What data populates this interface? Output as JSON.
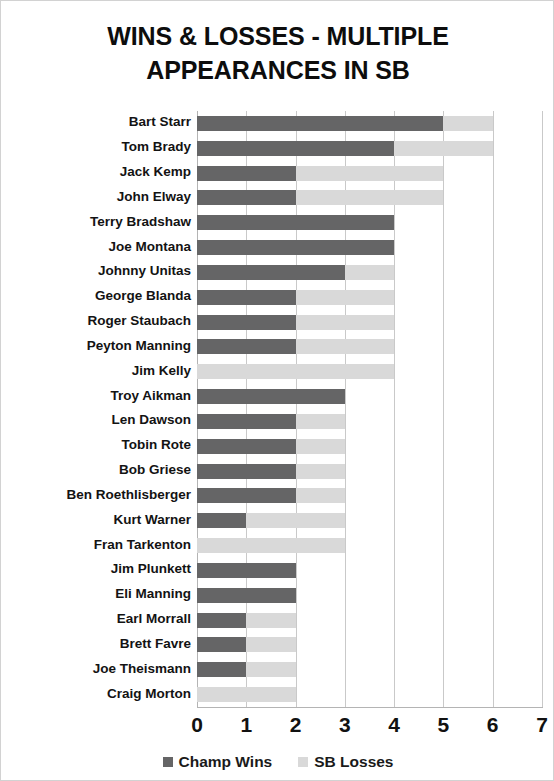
{
  "chart_data": {
    "type": "bar",
    "orientation": "horizontal",
    "stacked": true,
    "title": "WINS & LOSSES - MULTIPLE APPEARANCES IN SB",
    "title_lines": [
      "WINS & LOSSES - MULTIPLE",
      "APPEARANCES IN SB"
    ],
    "xlabel": "",
    "ylabel": "",
    "xlim": [
      0,
      7
    ],
    "xticks": [
      "0",
      "1",
      "2",
      "3",
      "4",
      "5",
      "6",
      "7"
    ],
    "grid": true,
    "legend_position": "bottom",
    "categories": [
      "Bart Starr",
      "Tom Brady",
      "Jack Kemp",
      "John Elway",
      "Terry Bradshaw",
      "Joe Montana",
      "Johnny Unitas",
      "George Blanda",
      "Roger Staubach",
      "Peyton Manning",
      "Jim Kelly",
      "Troy Aikman",
      "Len Dawson",
      "Tobin Rote",
      "Bob Griese",
      "Ben Roethlisberger",
      "Kurt Warner",
      "Fran Tarkenton",
      "Jim Plunkett",
      "Eli Manning",
      "Earl Morrall",
      "Brett Favre",
      "Joe Theismann",
      "Craig Morton"
    ],
    "series": [
      {
        "name": "Champ Wins",
        "color": "#656566",
        "values": [
          5,
          4,
          2,
          2,
          4,
          4,
          3,
          2,
          2,
          2,
          0,
          3,
          2,
          2,
          2,
          2,
          1,
          0,
          2,
          2,
          1,
          1,
          1,
          0
        ]
      },
      {
        "name": "SB Losses",
        "color": "#d9d9d9",
        "values": [
          1,
          2,
          3,
          3,
          0,
          0,
          1,
          2,
          2,
          2,
          4,
          0,
          1,
          1,
          1,
          1,
          2,
          3,
          0,
          0,
          1,
          1,
          1,
          2
        ]
      }
    ],
    "totals": [
      6,
      6,
      5,
      5,
      4,
      4,
      4,
      4,
      4,
      4,
      4,
      3,
      3,
      3,
      3,
      3,
      3,
      3,
      2,
      2,
      2,
      2,
      2,
      2
    ]
  },
  "legend": {
    "items": [
      {
        "label": "Champ Wins",
        "color": "#656566"
      },
      {
        "label": "SB Losses",
        "color": "#d9d9d9"
      }
    ]
  },
  "colors": {
    "champ_wins": "#656566",
    "sb_losses": "#d9d9d9",
    "gridline": "#c9c9c9",
    "text": "#131313",
    "frame_border": "#d2d2d2"
  }
}
